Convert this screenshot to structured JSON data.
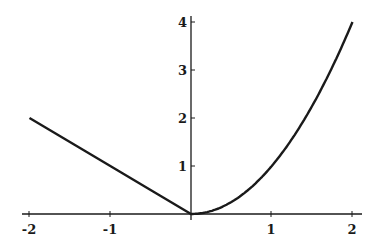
{
  "chart_data": {
    "type": "line",
    "title": "",
    "xlabel": "",
    "ylabel": "",
    "xlim": [
      -2,
      2
    ],
    "ylim": [
      0,
      4
    ],
    "grid": false,
    "legend": null,
    "x_ticks": [
      "-2",
      "-1",
      "1",
      "2"
    ],
    "y_ticks": [
      "1",
      "2",
      "3",
      "4"
    ],
    "series": [
      {
        "name": "piecewise f(x): -x for x<0, x^2 for x>=0",
        "x": [
          -2,
          -1.5,
          -1,
          -0.5,
          0,
          0.25,
          0.5,
          0.75,
          1,
          1.25,
          1.5,
          1.75,
          2
        ],
        "y": [
          2,
          1.5,
          1,
          0.5,
          0,
          0.0625,
          0.25,
          0.5625,
          1,
          1.5625,
          2.25,
          3.0625,
          4
        ]
      }
    ]
  },
  "axes": {
    "x_tick_labels": [
      "-2",
      "-1",
      "1",
      "2"
    ],
    "y_tick_labels": [
      "1",
      "2",
      "3",
      "4"
    ]
  },
  "colors": {
    "line": "#1a1a1a",
    "axis": "#1a1a1a",
    "background": "#ffffff"
  }
}
